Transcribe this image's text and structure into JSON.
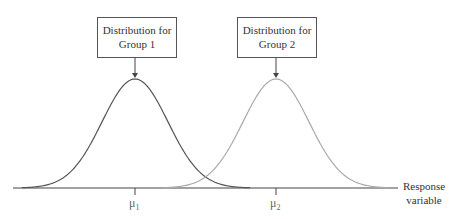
{
  "diagram": {
    "boxes": [
      {
        "line1": "Distribution for",
        "line2": "Group 1"
      },
      {
        "line1": "Distribution for",
        "line2": "Group 2"
      }
    ],
    "mean_labels": [
      {
        "symbol": "μ",
        "subscript": "1"
      },
      {
        "symbol": "μ",
        "subscript": "2"
      }
    ],
    "axis_label": {
      "line1": "Response",
      "line2": "variable"
    },
    "colors": {
      "group1_curve": "#555555",
      "group2_curve": "#aaaaaa",
      "axis": "#444444"
    }
  }
}
